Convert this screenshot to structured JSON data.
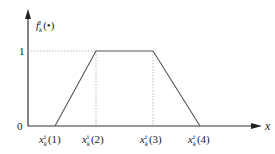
{
  "diagram": {
    "type": "trapezoidal-membership-function",
    "y_axis_label": {
      "main": "f",
      "sub": "k",
      "sup": "i",
      "arg": "(•)"
    },
    "x_axis_label": "x",
    "y_ticks": [
      {
        "label": "1"
      },
      {
        "label": "0"
      }
    ],
    "x_ticks": [
      {
        "main": "x",
        "sub": "k",
        "sup": "i",
        "arg": "(1)"
      },
      {
        "main": "x",
        "sub": "k",
        "sup": "i",
        "arg": "(2)"
      },
      {
        "main": "x",
        "sub": "k",
        "sup": "i",
        "arg": "(3)"
      },
      {
        "main": "x",
        "sub": "k",
        "sup": "i",
        "arg": "(4)"
      }
    ],
    "points": [
      {
        "x": "x_k^i(1)",
        "y": 0
      },
      {
        "x": "x_k^i(2)",
        "y": 1
      },
      {
        "x": "x_k^i(3)",
        "y": 1
      },
      {
        "x": "x_k^i(4)",
        "y": 0
      }
    ],
    "colors": {
      "line": "#555555",
      "axis": "#333333",
      "dashed": "#999999"
    }
  }
}
